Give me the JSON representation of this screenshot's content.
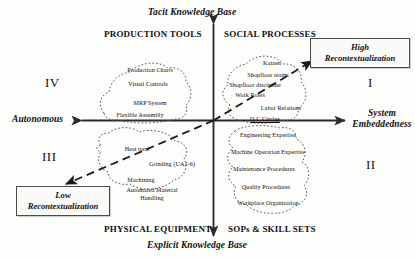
{
  "figure": {
    "axes": {
      "vertical_top": "Tacit Knowledge Base",
      "vertical_bottom": "Explicit Knowledge Base",
      "horizontal_left": "Autonomous",
      "horizontal_right_line1": "System",
      "horizontal_right_line2": "Embeddedness"
    },
    "quadrant_headings": {
      "top_left": "PRODUCTION TOOLS",
      "top_right": "SOCIAL PROCESSES",
      "bottom_left": "PHYSICAL EQUIPMENT",
      "bottom_right": "SOPs & SKILL SETS"
    },
    "quadrant_numbers": {
      "top_left": "IV",
      "top_right": "I",
      "bottom_left": "III",
      "bottom_right": "II"
    },
    "callouts": {
      "high_line1": "High",
      "high_line2": "Recontextualization",
      "low_line1": "Low",
      "low_line2": "Recontextualization"
    },
    "clusters": {
      "production_tools": [
        "Production Charts",
        "Visual Controls",
        "MRP System",
        "Flexible Assembly"
      ],
      "social_processes": [
        "Kaizen",
        "Shopfloor teams",
        "Shopfloor discipline",
        "Work Roles",
        "Labor Relations",
        "Q C Circles"
      ],
      "physical_equipment": [
        "Heat treat",
        "Grinding (UA1-6)",
        "Machining",
        "Automated Material",
        "Handling"
      ],
      "sops_skill_sets": [
        "Engineering Expertise",
        "Machine Operation Expertise",
        "Maintenance Procedures",
        "Quality Procedures",
        "Workplace Organization"
      ]
    },
    "colors": {
      "axis": "#2b2b2b",
      "blob_outline": "#555555",
      "callout_border": "#4a4a4a",
      "text": "#111111"
    }
  }
}
